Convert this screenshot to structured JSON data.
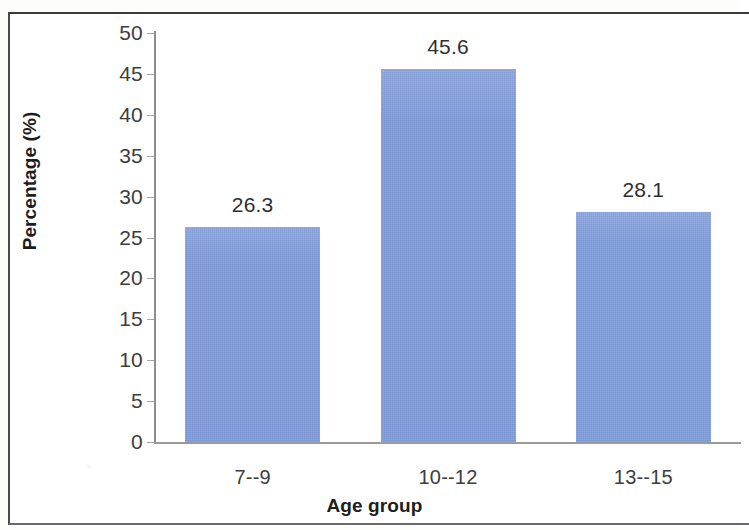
{
  "chart_data": {
    "type": "bar",
    "title": "",
    "subtitle": "",
    "xlabel": "Age group",
    "ylabel": "Percentage (%)",
    "categories": [
      "7--9",
      "10--12",
      "13--15"
    ],
    "values": [
      26.3,
      45.6,
      28.1
    ],
    "value_labels": [
      "26.3",
      "45.6",
      "28.1"
    ],
    "ylim": [
      0,
      50
    ],
    "ytick_step": 5,
    "yticks": [
      "50",
      "45",
      "40",
      "35",
      "30",
      "25",
      "20",
      "15",
      "10",
      "5",
      "0"
    ],
    "grid": false,
    "legend": null,
    "legend_position": "none",
    "series": [
      {
        "name": "Percentage",
        "values": [
          26.3,
          45.6,
          28.1
        ],
        "color": "#7F9CDB"
      }
    ],
    "bar_color": "#7F9CDB",
    "axis_color": "#8D8D8D",
    "text_color": "#3D3D3D",
    "frame_color": "#4A4A4A"
  }
}
